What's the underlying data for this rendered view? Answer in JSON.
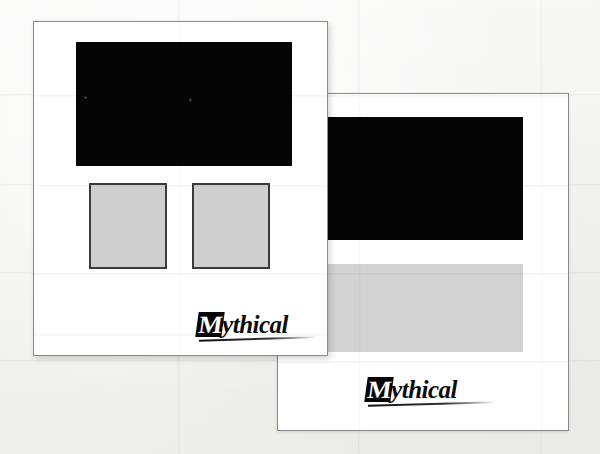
{
  "scene": {
    "title": "Mythical — two overlapping printed sheets",
    "background_color": "#f6f6f5",
    "sheet_color": "#ffffff",
    "sheet_border_color": "#8a8a8a",
    "black_block_color": "#050505",
    "gray_block_color": "#d2d2d2",
    "gray_block_border_color": "#3b3b3b",
    "fold_line_color": "#000000"
  },
  "sheets": [
    {
      "id": "back-sheet",
      "name": "Back sheet",
      "wordmark": {
        "cap": "M",
        "rest": "ythical",
        "full": "Mythical"
      },
      "blocks": [
        {
          "name": "hero-black-panel",
          "fill": "black"
        },
        {
          "name": "gray-swatch-panel",
          "fill": "gray"
        }
      ]
    },
    {
      "id": "front-sheet",
      "name": "Front sheet",
      "wordmark": {
        "cap": "M",
        "rest": "ythical",
        "full": "Mythical"
      },
      "blocks": [
        {
          "name": "hero-black-panel",
          "fill": "black"
        },
        {
          "name": "gray-swatch-left",
          "fill": "gray"
        },
        {
          "name": "gray-swatch-right",
          "fill": "gray"
        }
      ]
    }
  ],
  "fold_lines": {
    "horizontal_y": [
      94,
      184,
      272,
      360
    ],
    "vertical_x": [
      178,
      358,
      540
    ]
  }
}
